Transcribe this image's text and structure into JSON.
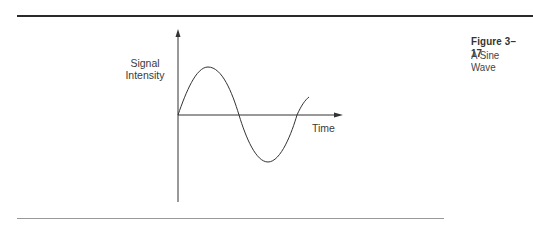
{
  "figure": {
    "number": "Figure 3–17",
    "title": "A Sine Wave"
  },
  "axes": {
    "y_label_line1": "Signal",
    "y_label_line2": "Intensity",
    "x_label": "Time"
  },
  "colors": {
    "line": "#333333",
    "rule_top": "#2a2a2a",
    "rule_bottom": "#999999"
  }
}
